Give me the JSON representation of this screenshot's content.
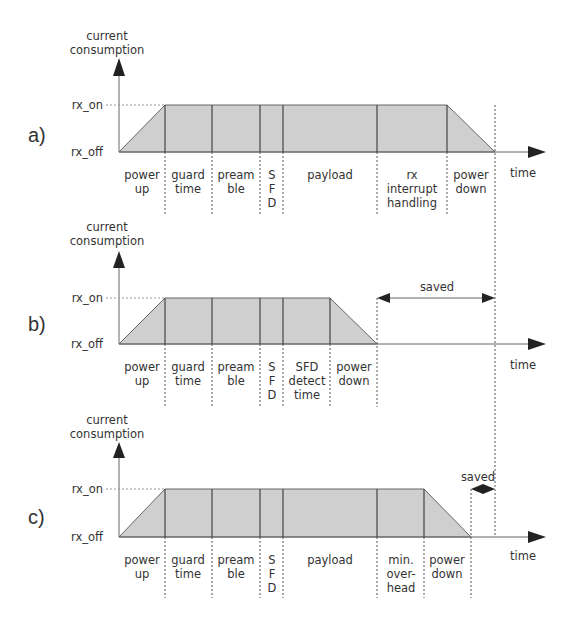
{
  "figure": {
    "y_axis_label_line1": "current",
    "y_axis_label_line2": "consumption",
    "x_axis_label": "time",
    "level_high": "rx_on",
    "level_low": "rx_off",
    "colors": {
      "fill": "#cfcfcf",
      "line": "#444444",
      "text": "#333333"
    }
  },
  "panels": [
    {
      "id": "a",
      "tag": "a)",
      "phases": [
        {
          "label": [
            "power",
            "up"
          ]
        },
        {
          "label": [
            "guard",
            "time"
          ]
        },
        {
          "label": [
            "pream",
            "ble"
          ]
        },
        {
          "label": [
            "S",
            "F",
            "D"
          ]
        },
        {
          "label": [
            "payload"
          ]
        },
        {
          "label": [
            "rx",
            "interrupt",
            "handling"
          ]
        },
        {
          "label": [
            "power",
            "down"
          ]
        }
      ]
    },
    {
      "id": "b",
      "tag": "b)",
      "phases": [
        {
          "label": [
            "power",
            "up"
          ]
        },
        {
          "label": [
            "guard",
            "time"
          ]
        },
        {
          "label": [
            "pream",
            "ble"
          ]
        },
        {
          "label": [
            "S",
            "F",
            "D"
          ]
        },
        {
          "label": [
            "SFD",
            "detect",
            "time"
          ]
        },
        {
          "label": [
            "power",
            "down"
          ]
        }
      ],
      "saved_label": "saved"
    },
    {
      "id": "c",
      "tag": "c)",
      "phases": [
        {
          "label": [
            "power",
            "up"
          ]
        },
        {
          "label": [
            "guard",
            "time"
          ]
        },
        {
          "label": [
            "pream",
            "ble"
          ]
        },
        {
          "label": [
            "S",
            "F",
            "D"
          ]
        },
        {
          "label": [
            "payload"
          ]
        },
        {
          "label": [
            "min.",
            "over-",
            "head"
          ]
        },
        {
          "label": [
            "power",
            "down"
          ]
        }
      ],
      "saved_label": "saved"
    }
  ]
}
